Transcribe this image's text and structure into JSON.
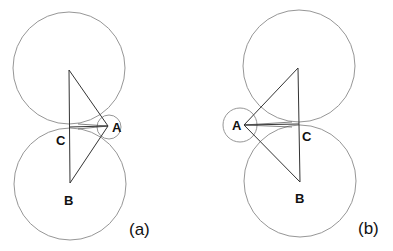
{
  "figures": [
    {
      "id": "a",
      "caption": "(a)",
      "labels": {
        "A": "A",
        "B": "B",
        "C": "C"
      },
      "circles": [
        {
          "name": "top-circle",
          "cx": 69,
          "cy": 68,
          "r": 56
        },
        {
          "name": "bottom-circle",
          "cx": 70,
          "cy": 184,
          "r": 56
        },
        {
          "name": "small-circle-A",
          "cx": 109,
          "cy": 127,
          "r": 12
        }
      ],
      "triangle": {
        "top": [
          69,
          70
        ],
        "B": [
          70,
          183
        ],
        "A": [
          108,
          126
        ]
      },
      "segment_AC": {
        "from": [
          108,
          126
        ],
        "to": [
          69,
          127
        ]
      }
    },
    {
      "id": "b",
      "caption": "(b)",
      "labels": {
        "A": "A",
        "B": "B",
        "C": "C"
      },
      "circles": [
        {
          "name": "top-circle",
          "cx": 299,
          "cy": 66,
          "r": 56
        },
        {
          "name": "bottom-circle",
          "cx": 300,
          "cy": 181,
          "r": 56
        },
        {
          "name": "small-circle-A",
          "cx": 240,
          "cy": 125,
          "r": 17
        }
      ],
      "triangle": {
        "top": [
          298,
          68
        ],
        "B": [
          300,
          182
        ],
        "A": [
          244,
          125
        ]
      },
      "segment_AC": {
        "from": [
          244,
          125
        ],
        "to": [
          299,
          124
        ]
      }
    }
  ]
}
